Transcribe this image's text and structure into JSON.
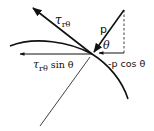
{
  "diagram": {
    "labels": {
      "shear_stress_symbol": "τ",
      "shear_stress_subscript": "rθ",
      "pressure": "p",
      "angle": "θ",
      "horizontal_shear_symbol": "τ",
      "horizontal_shear_subscript": "rθ",
      "horizontal_shear_suffix": " sin θ",
      "horizontal_pressure": "-p cos θ"
    },
    "colors": {
      "ink": "#111111",
      "background": "#ffffff"
    }
  }
}
